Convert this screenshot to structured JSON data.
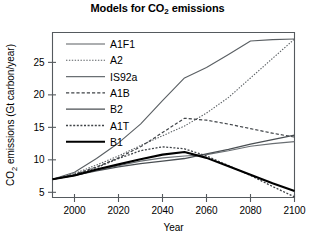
{
  "chart_data": {
    "type": "line",
    "title": "Models for CO2 emissions",
    "title_main": "Models for CO",
    "title_sub": "2",
    "title_tail": " emissions",
    "xlabel": "Year",
    "ylabel": "CO2 emissions (Gt carbon/year)",
    "ylabel_main": "CO",
    "ylabel_sub": "2",
    "ylabel_tail": " emissions (Gt carbon/year)",
    "xlim": [
      1990,
      2100
    ],
    "ylim": [
      4.2,
      29.6
    ],
    "xticks": [
      2000,
      2020,
      2040,
      2060,
      2080,
      2100
    ],
    "xtick_labels": [
      "2000",
      "2020",
      "2040",
      "2060",
      "2080",
      "2100"
    ],
    "yticks": [
      5,
      10,
      15,
      20,
      25
    ],
    "ytick_labels": [
      "5",
      "10",
      "15",
      "20",
      "25"
    ],
    "grid": false,
    "legend_position": "upper-left-inside",
    "x": [
      1990,
      2000,
      2010,
      2020,
      2030,
      2040,
      2050,
      2060,
      2070,
      2080,
      2090,
      2100
    ],
    "series": [
      {
        "name": "A1F1",
        "style": "solid",
        "width": 1.1,
        "color": "#5a5f63",
        "values": [
          7.0,
          8.1,
          10.2,
          12.6,
          15.5,
          19.1,
          22.6,
          24.2,
          26.2,
          28.3,
          28.5,
          28.6
        ]
      },
      {
        "name": "A2",
        "style": "dotted",
        "width": 1.1,
        "color": "#5a5f63",
        "values": [
          7.0,
          7.9,
          9.2,
          10.6,
          12.2,
          13.7,
          15.2,
          17.2,
          19.6,
          22.6,
          25.6,
          28.6
        ]
      },
      {
        "name": "IS92a",
        "style": "solid",
        "width": 1.1,
        "color": "#6a6f73",
        "values": [
          7.0,
          7.6,
          8.4,
          9.1,
          9.8,
          10.3,
          10.6,
          10.8,
          11.4,
          12.1,
          12.5,
          12.8
        ]
      },
      {
        "name": "A1B",
        "style": "dashed",
        "width": 1.2,
        "color": "#3f4347",
        "values": [
          7.0,
          7.8,
          8.9,
          10.3,
          12.0,
          14.2,
          16.4,
          16.1,
          15.5,
          14.8,
          14.1,
          13.5
        ]
      },
      {
        "name": "B2",
        "style": "solid",
        "width": 1.3,
        "color": "#4a4f53",
        "values": [
          7.0,
          7.6,
          8.3,
          8.9,
          9.4,
          9.8,
          10.2,
          10.9,
          11.6,
          12.4,
          13.1,
          13.8
        ]
      },
      {
        "name": "A1T",
        "style": "dotted",
        "width": 1.3,
        "color": "#3f4347",
        "values": [
          7.0,
          7.7,
          8.8,
          10.2,
          11.4,
          12.0,
          11.7,
          10.6,
          9.1,
          7.6,
          5.9,
          4.3
        ]
      },
      {
        "name": "B1",
        "style": "solid",
        "width": 2.1,
        "color": "#000000",
        "values": [
          7.0,
          7.6,
          8.5,
          9.3,
          10.1,
          10.8,
          11.2,
          10.3,
          9.0,
          7.7,
          6.4,
          5.2
        ]
      }
    ]
  },
  "legend": {
    "items": [
      {
        "label": "A1F1"
      },
      {
        "label": "A2"
      },
      {
        "label": "IS92a"
      },
      {
        "label": "A1B"
      },
      {
        "label": "B2"
      },
      {
        "label": "A1T"
      },
      {
        "label": "B1"
      }
    ]
  }
}
